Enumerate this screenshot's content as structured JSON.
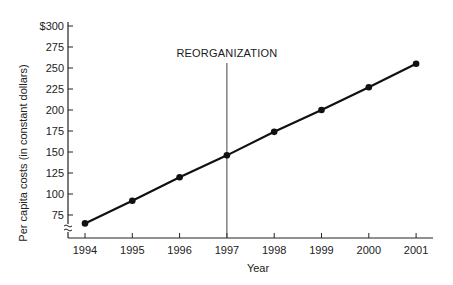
{
  "chart_data": {
    "type": "line",
    "title": "",
    "xlabel": "Year",
    "ylabel": "Per capita costs (in constant dollars)",
    "categories": [
      "1994",
      "1995",
      "1996",
      "1997",
      "1998",
      "1999",
      "2000",
      "2001"
    ],
    "series": [
      {
        "name": "Per capita costs",
        "values": [
          65,
          92,
          120,
          146,
          174,
          200,
          227,
          255
        ]
      }
    ],
    "yticks": [
      "$300",
      "275",
      "250",
      "225",
      "200",
      "175",
      "150",
      "125",
      "100",
      "75"
    ],
    "ytick_values": [
      300,
      275,
      250,
      225,
      200,
      175,
      150,
      125,
      100,
      75
    ],
    "ylim": [
      55,
      300
    ],
    "y_axis_break": true,
    "grid": false,
    "legend": null,
    "annotations": [
      {
        "text": "REORGANIZATION",
        "type": "vertical-line",
        "x": "1997"
      }
    ]
  }
}
